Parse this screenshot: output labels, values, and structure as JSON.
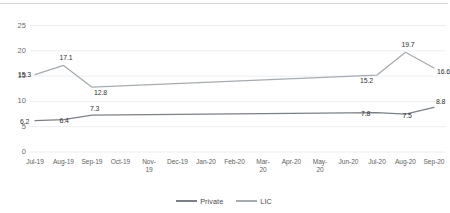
{
  "chart_data": {
    "type": "line",
    "title": "",
    "subtitle": "",
    "xlabel": "",
    "ylabel": "",
    "ylim": [
      0,
      25
    ],
    "ytick_labels": [
      "0",
      "5",
      "10",
      "15",
      "20",
      "25"
    ],
    "ytick_values": [
      0,
      5,
      10,
      15,
      20,
      25
    ],
    "grid": true,
    "legend_position": "bottom",
    "categories": [
      "Jul-19",
      "Aug-19",
      "Sep-19",
      "Oct-19",
      "Nov-19",
      "Dec-19",
      "Jan-20",
      "Feb-20",
      "Mar-20",
      "Apr-20",
      "May-20",
      "Jun-20",
      "Jul-20",
      "Aug-20",
      "Sep-20"
    ],
    "series": [
      {
        "name": "Private",
        "color": "#7b8086",
        "values": [
          6.2,
          6.4,
          7.3,
          null,
          null,
          null,
          null,
          null,
          null,
          null,
          null,
          null,
          7.8,
          7.5,
          8.8
        ],
        "labels": [
          "6.2",
          "6.4",
          "7.3",
          "",
          "",
          "",
          "",
          "",
          "",
          "",
          "",
          "",
          "7.8",
          "7.5",
          "8.8"
        ]
      },
      {
        "name": "LIC",
        "color": "#a6abb0",
        "values": [
          15.3,
          17.1,
          12.8,
          null,
          null,
          null,
          null,
          null,
          null,
          null,
          null,
          null,
          15.2,
          19.7,
          16.6
        ],
        "labels": [
          "15.3",
          "17.1",
          "12.8",
          "",
          "",
          "",
          "",
          "",
          "",
          "",
          "",
          "",
          "15.2",
          "19.7",
          "16.6"
        ]
      }
    ]
  },
  "legend": {
    "entries": [
      {
        "label": "Private"
      },
      {
        "label": "LIC"
      }
    ]
  }
}
